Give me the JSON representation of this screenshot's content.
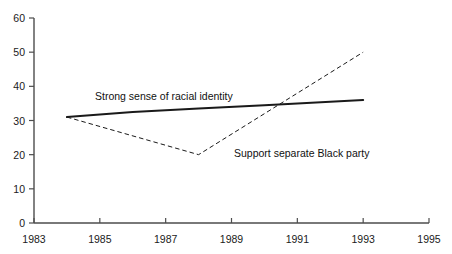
{
  "chart_data": {
    "type": "line",
    "title": "",
    "subtitle": "",
    "xlabel": "",
    "ylabel": "",
    "xlim": [
      1983,
      1995
    ],
    "ylim": [
      0,
      60
    ],
    "grid": false,
    "legend_position": "inline-annotations",
    "x_ticks": [
      1983,
      1985,
      1987,
      1989,
      1991,
      1993,
      1995
    ],
    "x_tick_labels": [
      "1983",
      "1985",
      "1987",
      "1989",
      "1991",
      "1993",
      "1995"
    ],
    "y_ticks": [
      0,
      10,
      20,
      30,
      40,
      50,
      60
    ],
    "y_tick_labels": [
      "0",
      "10",
      "20",
      "30",
      "40",
      "50",
      "60"
    ],
    "series": [
      {
        "name": "Strong sense of racial identity",
        "style": "solid",
        "color": "#1a1a1a",
        "width": 2,
        "x": [
          1984,
          1986,
          1988,
          1990,
          1993
        ],
        "values": [
          31,
          32.5,
          33.5,
          34.5,
          36
        ]
      },
      {
        "name": "Support separate Black party",
        "style": "dashed",
        "color": "#1a1a1a",
        "width": 1,
        "x": [
          1984,
          1988,
          1993
        ],
        "values": [
          31,
          20,
          50
        ]
      }
    ],
    "annotations": [
      {
        "text": "Strong sense of racial identity",
        "x_px": 95,
        "y_px": 91
      },
      {
        "text": "Support separate Black party",
        "x_px": 234,
        "y_px": 148
      }
    ]
  },
  "axes": {
    "x_axis_name": "year-axis",
    "y_axis_name": "percent-axis"
  }
}
